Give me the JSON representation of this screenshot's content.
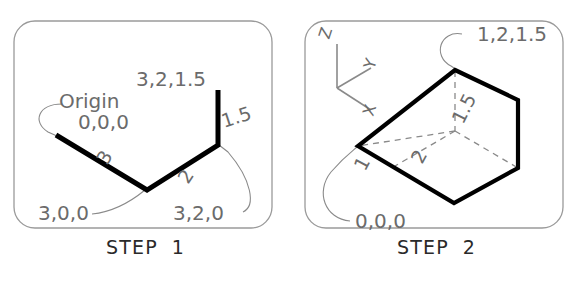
{
  "figure": {
    "background": "#ffffff",
    "panel_border_color": "#9a9a9a",
    "solid_line_color": "#000000",
    "dashed_line_color": "#8a8a8a",
    "leader_line_color": "#8a8a8a",
    "label_color": "#6b6b6b",
    "caption_color": "#2a2a2a"
  },
  "panels": [
    {
      "id": "step-1",
      "caption_word": "STEP",
      "caption_number": "1",
      "labels": {
        "origin_word": "Origin",
        "origin_coord": "0,0,0",
        "point_x": "3,0,0",
        "point_xy": "3,2,0",
        "point_xyz": "3,2,1.5",
        "dim_x": "3",
        "dim_y": "2",
        "dim_z": "1.5"
      },
      "vertices": [
        {
          "name": "origin",
          "coord": "0,0,0"
        },
        {
          "name": "x-end",
          "coord": "3,0,0"
        },
        {
          "name": "xy-end",
          "coord": "3,2,0"
        },
        {
          "name": "xyz-end",
          "coord": "3,2,1.5"
        }
      ]
    },
    {
      "id": "step-2",
      "caption_word": "STEP",
      "caption_number": "2",
      "labels": {
        "origin_coord": "0,0,0",
        "far_corner": "1,2,1.5",
        "dim_x": "1",
        "dim_y": "2",
        "dim_z": "1.5"
      },
      "axes": {
        "z": "Z",
        "y": "Y",
        "x": "X"
      }
    }
  ]
}
